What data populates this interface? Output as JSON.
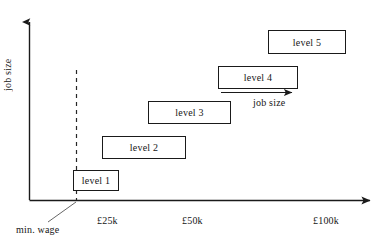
{
  "figure": {
    "kind": "scatter-band-diagram",
    "background_color": "#ffffff",
    "line_color": "#1a1a1a",
    "text_color": "#161616"
  },
  "axes": {
    "y_label": "job size",
    "x_ticks": [
      {
        "label": "£25k",
        "x": 97
      },
      {
        "label": "£50k",
        "x": 182
      },
      {
        "label": "£100k",
        "x": 313
      }
    ],
    "annotations": {
      "min_wage": "min. wage",
      "arrow_caption": "job size"
    }
  },
  "levels": [
    {
      "label": "level 1",
      "left": 73,
      "top": 170,
      "width": 46,
      "height": 21
    },
    {
      "label": "level 2",
      "left": 102,
      "top": 136,
      "width": 84,
      "height": 23
    },
    {
      "label": "level 3",
      "left": 148,
      "top": 101,
      "width": 83,
      "height": 23
    },
    {
      "label": "level 4",
      "left": 218,
      "top": 66,
      "width": 80,
      "height": 23
    },
    {
      "label": "level 5",
      "left": 268,
      "top": 30,
      "width": 78,
      "height": 24
    }
  ]
}
